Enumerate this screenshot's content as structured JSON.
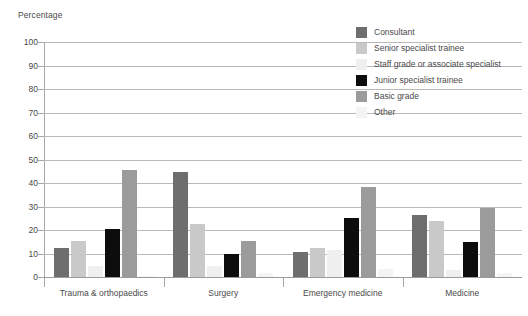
{
  "chart_data": {
    "type": "bar",
    "title": "",
    "ylabel": "Percentage",
    "xlabel": "",
    "ylim": [
      0,
      100
    ],
    "yticks": [
      0,
      10,
      20,
      30,
      40,
      50,
      60,
      70,
      80,
      90,
      100
    ],
    "grid": true,
    "legend_position": "top-right",
    "categories": [
      "Trauma & orthopaedics",
      "Surgery",
      "Emergency medicine",
      "Medicine"
    ],
    "series": [
      {
        "name": "Consultant",
        "color": "#6e6e6e",
        "values": [
          12.5,
          44.5,
          10.5,
          26.5
        ]
      },
      {
        "name": "Senior specialist trainee",
        "color": "#c9c9c9",
        "values": [
          15.5,
          22.5,
          12.5,
          24.0
        ]
      },
      {
        "name": "Staff grade or associate specialist",
        "color": "#efefef",
        "values": [
          4.5,
          4.5,
          11.5,
          3.0
        ]
      },
      {
        "name": "Junior specialist trainee",
        "color": "#0d0d0d",
        "values": [
          20.5,
          10.0,
          25.0,
          15.0
        ]
      },
      {
        "name": "Basic grade",
        "color": "#9b9b9b",
        "values": [
          45.5,
          15.5,
          38.5,
          29.5
        ]
      },
      {
        "name": "Other",
        "color": "#f4f4f4",
        "values": [
          0.3,
          1.5,
          3.5,
          1.5
        ]
      }
    ]
  },
  "colors": {
    "gridline": "#b9b9b9",
    "axis": "#a8a8a8",
    "text": "#4a4a4a",
    "background": "#ffffff"
  }
}
